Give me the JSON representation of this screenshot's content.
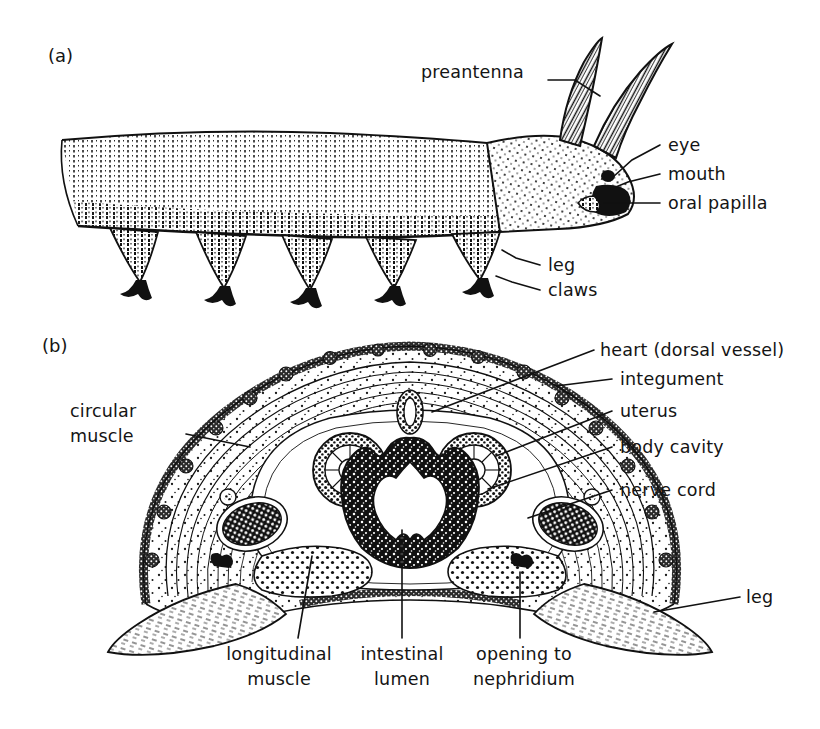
{
  "figure": {
    "background_color": "#ffffff",
    "ink_color": "#111111",
    "width": 820,
    "height": 729
  },
  "panels": [
    {
      "id": "a",
      "label": "(a)",
      "caption_x": 48,
      "caption_y": 62
    },
    {
      "id": "b",
      "label": "(b)",
      "caption_x": 42,
      "caption_y": 352
    }
  ],
  "panel_a": {
    "label": "(a)",
    "labels": [
      {
        "id": "preantenna",
        "text": "preantenna",
        "text_x": 421,
        "text_y": 78,
        "anchor": "start",
        "leader": [
          [
            548,
            80
          ],
          [
            575,
            80
          ],
          [
            600,
            96
          ]
        ]
      },
      {
        "id": "eye",
        "text": "eye",
        "text_x": 668,
        "text_y": 151,
        "anchor": "start",
        "leader": [
          [
            660,
            145
          ],
          [
            632,
            160
          ],
          [
            612,
            178
          ]
        ]
      },
      {
        "id": "mouth",
        "text": "mouth",
        "text_x": 668,
        "text_y": 180,
        "anchor": "start",
        "leader": [
          [
            660,
            174
          ],
          [
            628,
            182
          ],
          [
            610,
            190
          ]
        ]
      },
      {
        "id": "oral-papilla",
        "text": "oral papilla",
        "text_x": 668,
        "text_y": 209,
        "anchor": "start",
        "leader": [
          [
            660,
            203
          ],
          [
            616,
            203
          ],
          [
            606,
            203
          ]
        ]
      },
      {
        "id": "leg",
        "text": "leg",
        "text_x": 548,
        "text_y": 271,
        "anchor": "start",
        "leader": [
          [
            540,
            265
          ],
          [
            516,
            258
          ],
          [
            502,
            250
          ]
        ]
      },
      {
        "id": "claws",
        "text": "claws",
        "text_x": 548,
        "text_y": 296,
        "anchor": "start",
        "leader": [
          [
            540,
            290
          ],
          [
            512,
            282
          ],
          [
            498,
            277
          ]
        ]
      }
    ]
  },
  "panel_b": {
    "label": "(b)",
    "labels": [
      {
        "id": "circular-muscle",
        "text_lines": [
          "circular",
          "muscle"
        ],
        "text_x": 70,
        "text_y": 417,
        "line_gap": 25,
        "anchor": "start",
        "leader": [
          [
            186,
            434
          ],
          [
            248,
            447
          ]
        ]
      },
      {
        "id": "heart-dorsal-vessel",
        "text": "heart (dorsal vessel)",
        "text_x": 600,
        "text_y": 356,
        "anchor": "start",
        "leader": [
          [
            594,
            350
          ],
          [
            430,
            414
          ]
        ]
      },
      {
        "id": "integument",
        "text": "integument",
        "text_x": 620,
        "text_y": 385,
        "anchor": "start",
        "leader": [
          [
            612,
            379
          ],
          [
            556,
            385
          ]
        ]
      },
      {
        "id": "uterus",
        "text": "uterus",
        "text_x": 620,
        "text_y": 417,
        "anchor": "start",
        "leader": [
          [
            612,
            411
          ],
          [
            492,
            456
          ]
        ]
      },
      {
        "id": "body-cavity",
        "text": "body cavity",
        "text_x": 620,
        "text_y": 453,
        "anchor": "start",
        "leader": [
          [
            612,
            447
          ],
          [
            486,
            489
          ]
        ]
      },
      {
        "id": "nerve-cord",
        "text": "nerve cord",
        "text_x": 620,
        "text_y": 496,
        "anchor": "start",
        "leader": [
          [
            612,
            490
          ],
          [
            524,
            519
          ]
        ]
      },
      {
        "id": "leg",
        "text": "leg",
        "text_x": 746,
        "text_y": 603,
        "anchor": "start",
        "leader": [
          [
            740,
            597
          ],
          [
            652,
            612
          ]
        ]
      },
      {
        "id": "longitudinal-muscle",
        "text_lines": [
          "longitudinal",
          "muscle"
        ],
        "text_x": 279,
        "text_y": 660,
        "line_gap": 25,
        "anchor": "middle",
        "leader": [
          [
            298,
            638
          ],
          [
            312,
            555
          ]
        ]
      },
      {
        "id": "intestinal-lumen",
        "text_lines": [
          "intestinal",
          "lumen"
        ],
        "text_x": 402,
        "text_y": 660,
        "line_gap": 25,
        "anchor": "middle",
        "leader": [
          [
            402,
            638
          ],
          [
            402,
            528
          ]
        ]
      },
      {
        "id": "opening-to-nephridium",
        "text_lines": [
          "opening to",
          "nephridium"
        ],
        "text_x": 524,
        "text_y": 660,
        "line_gap": 25,
        "anchor": "middle",
        "leader": [
          [
            520,
            638
          ],
          [
            520,
            571
          ]
        ]
      }
    ],
    "structures": [
      {
        "name": "integument",
        "note": "bumpy papillated outer body wall outline"
      },
      {
        "name": "circular-muscle",
        "note": "concentric fine-line muscle layer beneath integument"
      },
      {
        "name": "longitudinal-muscle",
        "note": "stippled ventro-lateral muscle masses"
      },
      {
        "name": "body-cavity",
        "note": "stippled haemocoel space"
      },
      {
        "name": "heart",
        "note": "small dorsal ring-shaped vessel"
      },
      {
        "name": "uterus",
        "note": "paired radial-spoked circular organs"
      },
      {
        "name": "intestine",
        "note": "central folded gut with star-shaped lumen"
      },
      {
        "name": "nerve-cord",
        "note": "paired dark ventro-lateral ovals with pale cell dots"
      },
      {
        "name": "leg",
        "note": "stubby lateral lobopod with fine hatching"
      },
      {
        "name": "nephridium-opening",
        "note": "small pore at the leg base"
      }
    ]
  }
}
